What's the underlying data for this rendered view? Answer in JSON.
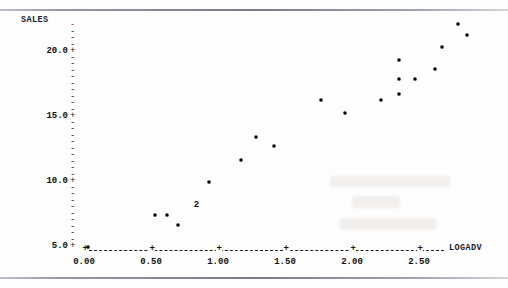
{
  "chart_data": {
    "type": "scatter",
    "title": "",
    "xlabel": "LOGADV",
    "ylabel": "SALES",
    "xlim": [
      -0.08,
      2.95
    ],
    "ylim": [
      4.35,
      22.6
    ],
    "grid": false,
    "legend": null,
    "x_tick_labels": [
      "0.00",
      "0.50",
      "1.00",
      "1.50",
      "2.00",
      "2.50"
    ],
    "x_ticks": [
      0.0,
      0.5,
      1.0,
      1.5,
      2.0,
      2.5
    ],
    "y_tick_labels": [
      "5.0+",
      "10.0+",
      "15.0+",
      "20.0+"
    ],
    "y_ticks": [
      5.0,
      10.0,
      15.0,
      20.0
    ],
    "y_minor_ticks": [
      5.5,
      6.0,
      6.5,
      7.0,
      7.5,
      8.0,
      8.5,
      9.0,
      9.5,
      10.5,
      11.0,
      11.5,
      12.0,
      12.5,
      13.0,
      13.5,
      14.0,
      14.5,
      15.5,
      16.0,
      16.5,
      17.0,
      17.5,
      18.0,
      18.5,
      19.0,
      19.5,
      20.5,
      21.0,
      21.5,
      22.0
    ],
    "axis_style": "character-plot (Minitab style) with dashed x-axis and dash/plus y-axis ticks",
    "points": [
      {
        "x": 0.03,
        "y": 4.9,
        "label": ""
      },
      {
        "x": 0.53,
        "y": 7.4,
        "label": ""
      },
      {
        "x": 0.62,
        "y": 7.4,
        "label": ""
      },
      {
        "x": 0.7,
        "y": 6.6,
        "label": ""
      },
      {
        "x": 0.93,
        "y": 9.9,
        "label": ""
      },
      {
        "x": 1.17,
        "y": 11.6,
        "label": ""
      },
      {
        "x": 1.28,
        "y": 13.35,
        "label": ""
      },
      {
        "x": 1.42,
        "y": 12.7,
        "label": ""
      },
      {
        "x": 1.77,
        "y": 16.25,
        "label": ""
      },
      {
        "x": 1.95,
        "y": 15.2,
        "label": ""
      },
      {
        "x": 2.22,
        "y": 16.25,
        "label": ""
      },
      {
        "x": 2.35,
        "y": 19.3,
        "label": ""
      },
      {
        "x": 2.35,
        "y": 17.85,
        "label": ""
      },
      {
        "x": 2.35,
        "y": 16.7,
        "label": ""
      },
      {
        "x": 2.47,
        "y": 17.85,
        "label": ""
      },
      {
        "x": 2.62,
        "y": 18.6,
        "label": ""
      },
      {
        "x": 2.67,
        "y": 20.3,
        "label": ""
      },
      {
        "x": 2.79,
        "y": 22.05,
        "label": ""
      },
      {
        "x": 2.86,
        "y": 21.2,
        "label": ""
      }
    ],
    "overplot_markers": [
      {
        "x": 0.84,
        "y": 8.15,
        "label": "2",
        "meaning": "two coincident observations"
      }
    ],
    "colors": {
      "point": "#0b0b0b",
      "axis": "#1a1a1a",
      "axis_title": "#141a2e",
      "top_tick_accent": "#c0392b",
      "background": "#fdfdfd",
      "page_rule": "#6f7580"
    }
  },
  "axes": {
    "y_axis_title": "SALES",
    "x_axis_title": "LOGADV"
  }
}
